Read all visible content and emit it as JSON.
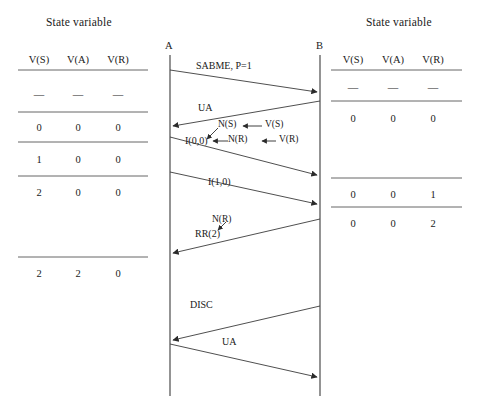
{
  "diagram": {
    "title_left": "State variable",
    "title_right": "State variable",
    "node_a": "A",
    "node_b": "B"
  },
  "left_table": {
    "headers": [
      "V(S)",
      "V(A)",
      "V(R)"
    ],
    "rows": [
      {
        "values": [
          "—",
          "—",
          "—"
        ]
      },
      {
        "values": [
          "0",
          "0",
          "0"
        ]
      },
      {
        "values": [
          "1",
          "0",
          "0"
        ]
      },
      {
        "values": [
          "2",
          "0",
          "0"
        ]
      },
      {
        "values": [
          "2",
          "2",
          "0"
        ]
      }
    ]
  },
  "right_table": {
    "headers": [
      "V(S)",
      "V(A)",
      "V(R)"
    ],
    "rows": [
      {
        "values": [
          "—",
          "—",
          "—"
        ]
      },
      {
        "values": [
          "0",
          "0",
          "0"
        ]
      },
      {
        "values": [
          "0",
          "0",
          "1"
        ]
      },
      {
        "values": [
          "0",
          "0",
          "2"
        ]
      }
    ]
  },
  "messages": [
    {
      "label": "SABME, P=1",
      "from": "A",
      "to": "B"
    },
    {
      "label": "UA",
      "from": "B",
      "to": "A"
    },
    {
      "label": "I(0,0)",
      "from": "A",
      "to": "B"
    },
    {
      "label": "I(1,0)",
      "from": "A",
      "to": "B"
    },
    {
      "label": "RR(2)",
      "from": "B",
      "to": "A"
    },
    {
      "label": "DISC",
      "from": "B",
      "to": "A"
    },
    {
      "label": "UA",
      "from": "A",
      "to": "B"
    }
  ],
  "annotations": {
    "ns": "N(S)",
    "vs": "V(S)",
    "nr": "N(R)",
    "vr": "V(R)",
    "nr2": "N(R)"
  },
  "colors": {
    "line": "#3b3b3b",
    "rule": "#555555",
    "text": "#1a1a1a"
  }
}
